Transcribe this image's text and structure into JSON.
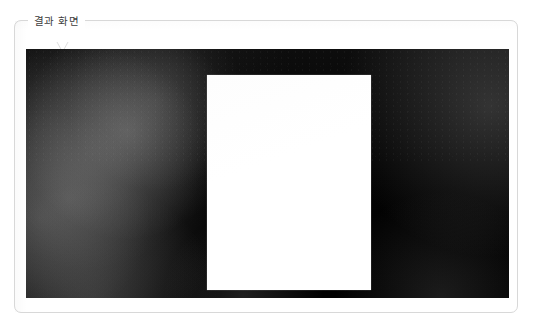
{
  "page": {
    "background_color": "#ffffff",
    "width": 536,
    "height": 332
  },
  "panel": {
    "legend_label": "결과 화면",
    "border_color": "#d8d8d8",
    "background_color": "#ffffff",
    "corner_radius_px": 7,
    "artifact_icon": "caret-mark-icon"
  },
  "photo": {
    "name": "result-photograph",
    "alt_text": "결과 화면",
    "background_color": "#050505",
    "description": "어두운 배경 사진",
    "highlight_blobs": [
      {
        "x_pct": 9,
        "y_pct": 60,
        "intensity": 0.3
      },
      {
        "x_pct": 21,
        "y_pct": 33,
        "intensity": 0.28
      },
      {
        "x_pct": 27,
        "y_pct": 21,
        "intensity": 0.16
      },
      {
        "x_pct": 13,
        "y_pct": 42,
        "intensity": 0.14
      },
      {
        "x_pct": 4,
        "y_pct": 26,
        "intensity": 0.12
      },
      {
        "x_pct": 3,
        "y_pct": 68,
        "intensity": 0.22
      },
      {
        "x_pct": 14,
        "y_pct": 105,
        "intensity": 0.26
      },
      {
        "x_pct": 45,
        "y_pct": 99,
        "intensity": 0.2
      },
      {
        "x_pct": 86,
        "y_pct": 100,
        "intensity": 0.18
      },
      {
        "x_pct": 96,
        "y_pct": 23,
        "intensity": 0.26
      }
    ],
    "white_sheet": {
      "name": "white-sheet",
      "color": "#ffffff",
      "content": ""
    }
  }
}
